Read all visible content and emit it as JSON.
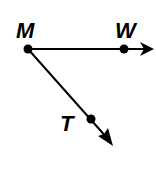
{
  "diagram": {
    "type": "geometry-rays",
    "stroke_color": "#000000",
    "background": "#ffffff",
    "points": [
      {
        "id": "M",
        "label": "M",
        "x": 28,
        "y": 49,
        "label_x": 18,
        "label_y": 38
      },
      {
        "id": "W",
        "label": "W",
        "x": 124,
        "y": 49,
        "label_x": 115,
        "label_y": 38
      },
      {
        "id": "T",
        "label": "T",
        "x": 91,
        "y": 119,
        "label_x": 60,
        "label_y": 130
      }
    ],
    "rays": [
      {
        "name": "ray-MW",
        "from": "M",
        "through": "W",
        "tip_x": 154,
        "tip_y": 49
      },
      {
        "name": "ray-MT",
        "from": "M",
        "through": "T",
        "tip_x": 113,
        "tip_y": 146
      }
    ]
  }
}
